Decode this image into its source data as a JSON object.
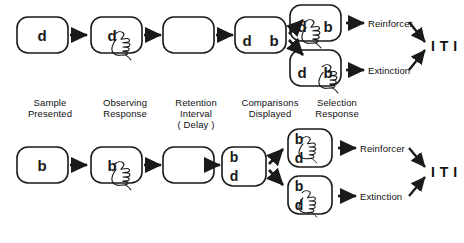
{
  "figure": {
    "type": "flow-diagram",
    "line_color": "#1a1a1a",
    "background": "#ffffff"
  },
  "stage_labels": [
    {
      "id": "sample-presented",
      "text": "Sample\nPresented",
      "x": 50,
      "y": 101
    },
    {
      "id": "observing-response",
      "text": "Observing\nResponse",
      "x": 125,
      "y": 101
    },
    {
      "id": "retention-interval",
      "text": "Retention\nInterval\n( Delay )",
      "x": 196,
      "y": 101
    },
    {
      "id": "comparisons-displayed",
      "text": "Comparisons\nDisplayed",
      "x": 270,
      "y": 101
    },
    {
      "id": "selection-response",
      "text": "Selection\nResponse",
      "x": 337,
      "y": 101
    }
  ],
  "rows": [
    {
      "id": "row-d-sample",
      "sample_letter": "d",
      "observing_letter": "d",
      "retention_letter": "",
      "comparison_letters": [
        "d",
        "b"
      ],
      "comparison_layout": "horizontal",
      "branches": [
        {
          "id": "correct",
          "letters": [
            "d",
            "b"
          ],
          "layout": "horizontal",
          "selected": "d",
          "outcome": "Reinforcer"
        },
        {
          "id": "incorrect",
          "letters": [
            "d",
            "b"
          ],
          "layout": "horizontal",
          "selected": "b",
          "outcome": "Extinction"
        }
      ],
      "iti": "I T I"
    },
    {
      "id": "row-b-sample",
      "sample_letter": "b",
      "observing_letter": "b",
      "retention_letter": "",
      "comparison_letters": [
        "b",
        "d"
      ],
      "comparison_layout": "vertical",
      "branches": [
        {
          "id": "correct",
          "letters": [
            "b",
            "d"
          ],
          "layout": "vertical",
          "selected": "b",
          "outcome": "Reinforcer"
        },
        {
          "id": "incorrect",
          "letters": [
            "b",
            "d"
          ],
          "layout": "vertical",
          "selected": "d",
          "outcome": "Extinction"
        }
      ],
      "iti": "I T I"
    }
  ],
  "letters": {
    "r1_sample": "d",
    "r1_observing": "d",
    "r1_cmp_left": "d",
    "r1_cmp_right": "b",
    "r1_top_left": "d",
    "r1_top_right": "b",
    "r1_bot_left": "d",
    "r1_bot_right": "b",
    "r2_sample": "b",
    "r2_observing": "b",
    "r2_cmp_top": "b",
    "r2_cmp_bot": "d",
    "r2_top_top": "b",
    "r2_top_bot": "d",
    "r2_bot_top": "b",
    "r2_bot_bot": "d"
  },
  "outcomes": {
    "r1_reinforcer": "Reinforcer",
    "r1_extinction": "Extinction",
    "r2_reinforcer": "Reinforcer",
    "r2_extinction": "Extinction"
  },
  "iti": {
    "row1": "I T I",
    "row2": "I T I"
  }
}
